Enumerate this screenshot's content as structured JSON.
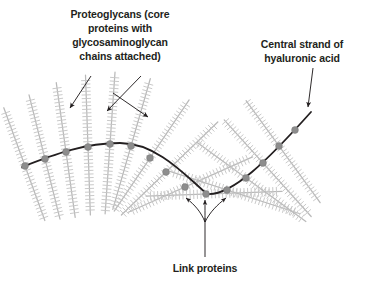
{
  "figure": {
    "background_color": "#ffffff",
    "title": "",
    "type": "scientific-diagram"
  },
  "labels": {
    "proteoglycans": {
      "lines": [
        "Proteoglycans (core",
        "proteins with",
        "glycosaminoglycan",
        "chains attached)"
      ],
      "align": "center",
      "color": "#231f20"
    },
    "central_strand": {
      "lines": [
        "Central strand of",
        "hyaluronic acid"
      ],
      "align": "center",
      "color": "#231f20"
    },
    "link_proteins": {
      "lines": [
        "Link proteins"
      ],
      "align": "center",
      "color": "#231f20"
    }
  },
  "colors": {
    "strand": "#231f20",
    "node": "#8d8d8d",
    "node_stroke": "#7a7a7a",
    "proteoglycan": "#b9b9b9",
    "proteoglycan_bristle": "#c6c6c6",
    "arrow": "#231f20",
    "text": "#231f20"
  },
  "geometry": {
    "strand_path": "M 22,167 C 55,154 85,143 120,143 C 158,143 188,178 207,194 C 232,196 268,160 311,112",
    "strand_width": 1.8,
    "node_radius": 3.4,
    "nodes": [
      {
        "x": 25,
        "y": 166
      },
      {
        "x": 45,
        "y": 159
      },
      {
        "x": 66,
        "y": 152
      },
      {
        "x": 88,
        "y": 147
      },
      {
        "x": 110,
        "y": 144
      },
      {
        "x": 131,
        "y": 146
      },
      {
        "x": 150,
        "y": 158
      },
      {
        "x": 166,
        "y": 172
      },
      {
        "x": 185,
        "y": 187
      },
      {
        "x": 206,
        "y": 194
      },
      {
        "x": 227,
        "y": 190
      },
      {
        "x": 246,
        "y": 178
      },
      {
        "x": 263,
        "y": 163
      },
      {
        "x": 279,
        "y": 146
      },
      {
        "x": 295,
        "y": 130
      }
    ],
    "proteoglycans": [
      {
        "x": 25,
        "y": 166,
        "angle": 110,
        "len_out": 62,
        "len_in": 58
      },
      {
        "x": 45,
        "y": 159,
        "angle": 104,
        "len_out": 66,
        "len_in": 62
      },
      {
        "x": 66,
        "y": 152,
        "angle": 98,
        "len_out": 70,
        "len_in": 66
      },
      {
        "x": 88,
        "y": 147,
        "angle": 92,
        "len_out": 72,
        "len_in": 68
      },
      {
        "x": 110,
        "y": 144,
        "angle": 86,
        "len_out": 72,
        "len_in": 70
      },
      {
        "x": 131,
        "y": 146,
        "angle": 74,
        "len_out": 70,
        "len_in": 66
      },
      {
        "x": 150,
        "y": 158,
        "angle": 56,
        "len_out": 70,
        "len_in": 64
      },
      {
        "x": 166,
        "y": 172,
        "angle": 44,
        "len_out": 72,
        "len_in": 62
      },
      {
        "x": 185,
        "y": 187,
        "angle": 24,
        "len_out": 74,
        "len_in": 62
      },
      {
        "x": 206,
        "y": 194,
        "angle": 2,
        "len_out": 76,
        "len_in": 60
      },
      {
        "x": 227,
        "y": 190,
        "angle": -18,
        "len_out": 76,
        "len_in": 60
      },
      {
        "x": 246,
        "y": 178,
        "angle": -36,
        "len_out": 74,
        "len_in": 60
      },
      {
        "x": 263,
        "y": 163,
        "angle": -48,
        "len_out": 72,
        "len_in": 58
      },
      {
        "x": 279,
        "y": 146,
        "angle": -54,
        "len_out": 70,
        "len_in": 56
      }
    ],
    "bristle_spacing": 3.6,
    "bristle_length": 4.2,
    "label_arrows": [
      {
        "name": "proteoglycan-arrow-left",
        "x1": 91,
        "y1": 76,
        "x2": 70,
        "y2": 108
      },
      {
        "name": "proteoglycan-arrow-mid",
        "x1": 141,
        "y1": 76,
        "x2": 107,
        "y2": 111
      },
      {
        "name": "proteoglycan-arrow-right",
        "x1": 113,
        "y1": 93,
        "x2": 148,
        "y2": 117
      },
      {
        "name": "central-strand-arrow",
        "x1": 313,
        "y1": 68,
        "x2": 308,
        "y2": 107
      }
    ],
    "link_arrows": {
      "stem": {
        "x1": 205,
        "y1": 257,
        "x2": 205,
        "y2": 218
      },
      "branches": [
        {
          "d": "M 205,222 C 201,212 195,205 186,198",
          "tip": {
            "x": 184,
            "y": 197
          }
        },
        {
          "d": "M 205,222 C 205,213 205,207 205,200",
          "tip": {
            "x": 205,
            "y": 199
          }
        },
        {
          "d": "M 205,222 C 210,212 217,205 226,198",
          "tip": {
            "x": 228,
            "y": 197
          }
        }
      ]
    },
    "text_positions": {
      "proteoglycans": {
        "x": 120,
        "y": 18,
        "line_height": 14
      },
      "central_strand": {
        "x": 302,
        "y": 48,
        "line_height": 14
      },
      "link_proteins": {
        "x": 205,
        "y": 272,
        "line_height": 14
      }
    }
  }
}
